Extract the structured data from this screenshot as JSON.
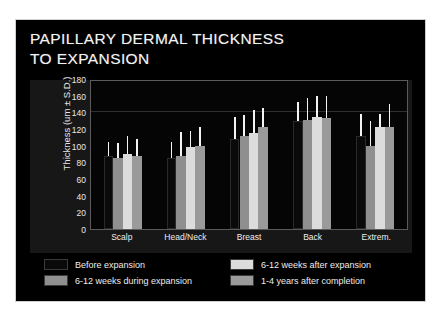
{
  "slide": {
    "background": "#000000",
    "title_line_1": "PAPILLARY DERMAL THICKNESS",
    "title_line_2": "TO EXPANSION"
  },
  "chart_data": {
    "type": "bar",
    "title": "PAPILLARY DERMAL THICKNESS TO EXPANSION",
    "xlabel": "",
    "ylabel": "Thickness (um ± S.D.)",
    "ylim": [
      0,
      180
    ],
    "yticks": [
      180,
      160,
      140,
      120,
      100,
      80,
      60,
      40,
      20,
      0
    ],
    "grid": true,
    "legend_position": "bottom",
    "categories": [
      "Scalp",
      "Head/Neck",
      "Breast",
      "Back",
      "Extrem."
    ],
    "series": [
      {
        "name": "Before expansion",
        "color": "#0a0a0a",
        "values": [
          88,
          85,
          108,
          130,
          112
        ],
        "errors": [
          16,
          19,
          26,
          22,
          26
        ]
      },
      {
        "name": "6-12 weeks during expansion",
        "color": "#8f8f8f",
        "values": [
          85,
          88,
          112,
          131,
          100
        ],
        "errors": [
          18,
          28,
          25,
          26,
          30
        ]
      },
      {
        "name": "6-12 weeks after expansion",
        "color": "#dcdcdc",
        "values": [
          90,
          98,
          115,
          134,
          122
        ],
        "errors": [
          22,
          20,
          28,
          26,
          16
        ]
      },
      {
        "name": "1-4 years after completion",
        "color": "#9a9a9a",
        "values": [
          88,
          100,
          122,
          133,
          122
        ],
        "errors": [
          20,
          23,
          23,
          27,
          28
        ]
      }
    ]
  },
  "legend": {
    "items": [
      {
        "label": "Before expansion",
        "color": "#0a0a0a"
      },
      {
        "label": "6-12 weeks during expansion",
        "color": "#8f8f8f"
      },
      {
        "label": "6-12 weeks after expansion",
        "color": "#dcdcdc"
      },
      {
        "label": "1-4 years after completion",
        "color": "#9a9a9a"
      }
    ]
  }
}
